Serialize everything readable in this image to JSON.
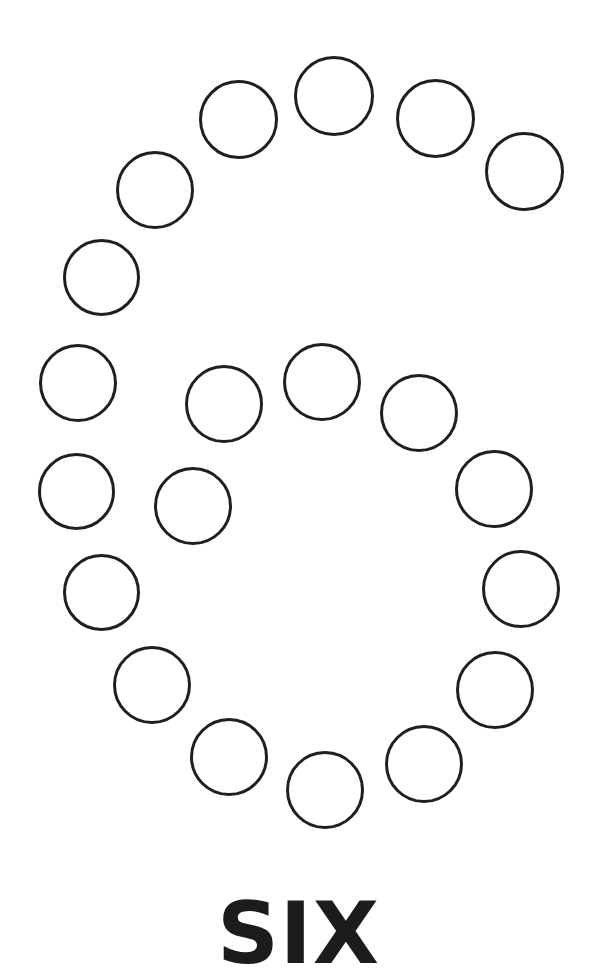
{
  "page": {
    "kind": "tracing-worksheet",
    "width": 597,
    "height": 976,
    "background_color": "#ffffff"
  },
  "figure": {
    "name": "numeral-six-dot-outline",
    "depicts_numeral": "6",
    "dot_count": 21,
    "dot_outline_color": "#1f1f1f",
    "dot_fill_color": "#ffffff",
    "dot_stroke_width": 3,
    "dot_diameter": 78,
    "dots": [
      {
        "id": "dot-01",
        "cx": 334,
        "cy": 96,
        "d": 80
      },
      {
        "id": "dot-02",
        "cx": 238,
        "cy": 119,
        "d": 79
      },
      {
        "id": "dot-03",
        "cx": 435,
        "cy": 118,
        "d": 79
      },
      {
        "id": "dot-04",
        "cx": 155,
        "cy": 190,
        "d": 78
      },
      {
        "id": "dot-05",
        "cx": 524,
        "cy": 171,
        "d": 79
      },
      {
        "id": "dot-06",
        "cx": 101,
        "cy": 277,
        "d": 77
      },
      {
        "id": "dot-07",
        "cx": 78,
        "cy": 383,
        "d": 78
      },
      {
        "id": "dot-08",
        "cx": 224,
        "cy": 404,
        "d": 78
      },
      {
        "id": "dot-09",
        "cx": 322,
        "cy": 382,
        "d": 78
      },
      {
        "id": "dot-10",
        "cx": 419,
        "cy": 413,
        "d": 78
      },
      {
        "id": "dot-11",
        "cx": 76,
        "cy": 491,
        "d": 77
      },
      {
        "id": "dot-12",
        "cx": 193,
        "cy": 506,
        "d": 78
      },
      {
        "id": "dot-13",
        "cx": 494,
        "cy": 489,
        "d": 78
      },
      {
        "id": "dot-14",
        "cx": 101,
        "cy": 592,
        "d": 77
      },
      {
        "id": "dot-15",
        "cx": 521,
        "cy": 589,
        "d": 78
      },
      {
        "id": "dot-16",
        "cx": 152,
        "cy": 685,
        "d": 78
      },
      {
        "id": "dot-17",
        "cx": 495,
        "cy": 690,
        "d": 78
      },
      {
        "id": "dot-18",
        "cx": 229,
        "cy": 757,
        "d": 78
      },
      {
        "id": "dot-19",
        "cx": 424,
        "cy": 764,
        "d": 78
      },
      {
        "id": "dot-20",
        "cx": 325,
        "cy": 790,
        "d": 78
      },
      {
        "id": "dot-21",
        "cx": 230,
        "cy": 757,
        "d": 0
      }
    ]
  },
  "caption": {
    "text": "SIX",
    "color": "#1c1c1c",
    "font_size_px": 86,
    "top_px": 890
  }
}
